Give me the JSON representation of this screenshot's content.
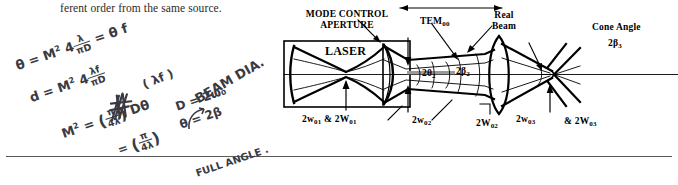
{
  "page": {
    "body_text": "ferent order from the same source."
  },
  "handwriting": {
    "eq1": {
      "theta": "θ",
      "eq": "=",
      "m2": "M",
      "exp": "2",
      "coef": "4",
      "num": "λ",
      "den": "πD",
      "tail_eq": "=",
      "tail": "θ f"
    },
    "eq2": {
      "d": "d",
      "eq": "=",
      "m2": "M",
      "exp": "2",
      "coef": "4",
      "num": "λf",
      "den": "πD"
    },
    "eq3": {
      "m2": "M",
      "exp": "2",
      "eq": "=",
      "open": "(",
      "num": "π",
      "den": "4λ",
      "close": ")",
      "tail": "Dθ"
    },
    "eq4": {
      "eq": "=",
      "open": "(",
      "num": "π",
      "den": "4λ",
      "close": ")"
    },
    "eq5": {
      "text": "D = 2ω₀"
    },
    "eq6": {
      "text": "θ = 2β"
    },
    "eq7": {
      "text": "BEAM DIA."
    },
    "eq8": {
      "text": "FULL ANGLE ."
    },
    "eq9": {
      "text": "( λf )"
    }
  },
  "diagram": {
    "labels": {
      "mode_control_line1": "MODE CONTROL",
      "mode_control_line2": "APERTURE",
      "laser": "LASER",
      "tem": "TEM",
      "tem_sub": "00",
      "real_beam_line1": "Real",
      "real_beam_line2": "Beam",
      "cone_angle": "Cone Angle",
      "two_beta_3": "2β",
      "two_beta_3_sub": "3",
      "two_theta_2": "2θ",
      "two_theta_2_sub": "2",
      "two_beta_2": "2β",
      "two_beta_2_sub": "2",
      "w01": "2w",
      "w01_sub": "01",
      "amp1": "&",
      "W01": "2W",
      "W01_sub": "01",
      "w02": "2w",
      "w02_sub": "02",
      "W02": "2W",
      "W02_sub": "02",
      "w03": "2w",
      "w03_sub": "03",
      "amp3": "&",
      "W03": "2W",
      "W03_sub": "03"
    }
  }
}
